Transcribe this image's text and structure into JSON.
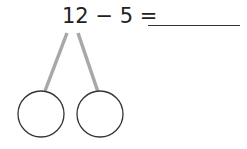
{
  "problem": {
    "equation_text": "12 − 5 =",
    "minuend": "12",
    "subtrahend": "5",
    "answer_value": ""
  },
  "number_bond": {
    "parts": [
      {
        "value": ""
      },
      {
        "value": ""
      }
    ],
    "colors": {
      "branch": "#a8a8a8",
      "circle_stroke": "#333333",
      "text": "#222222"
    }
  }
}
